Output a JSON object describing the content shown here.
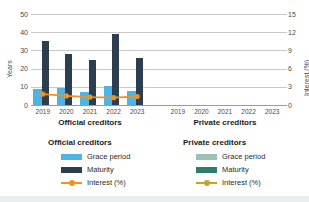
{
  "chart_data": {
    "type": "bar",
    "title": "",
    "panels": [
      {
        "name": "official",
        "title": "Official creditors",
        "categories": [
          "2019",
          "2020",
          "2021",
          "2022",
          "2023"
        ],
        "series": [
          {
            "name": "Grace period",
            "values": [
              9,
              9.5,
              7,
              10.5,
              7.5
            ],
            "color": "#4fb3e3",
            "axis": "left",
            "type": "bar"
          },
          {
            "name": "Maturity",
            "values": [
              35,
              28,
              24.5,
              39,
              26
            ],
            "color": "#2c3e50",
            "axis": "left",
            "type": "bar"
          },
          {
            "name": "Interest (%)",
            "values": [
              1.8,
              1.5,
              1.3,
              1.2,
              1.4
            ],
            "color": "#f5921e",
            "axis": "right",
            "type": "line"
          }
        ]
      },
      {
        "name": "private",
        "title": "Private creditors",
        "categories": [
          "2019",
          "2020",
          "2021",
          "2022",
          "2023"
        ],
        "series": [
          {
            "name": "Grace period",
            "values": [],
            "color": "#9dc1b4",
            "axis": "left",
            "type": "bar"
          },
          {
            "name": "Maturity",
            "values": [],
            "color": "#2e7d6e",
            "axis": "left",
            "type": "bar"
          },
          {
            "name": "Interest (%)",
            "values": [],
            "color": "#c9a227",
            "axis": "right",
            "type": "line"
          }
        ]
      }
    ],
    "ylabel": "Years",
    "ylim": [
      0,
      50
    ],
    "yticks": [
      "50",
      "40",
      "30",
      "20",
      "10",
      "0"
    ],
    "y2label": "Interest (%)",
    "y2lim": [
      0,
      15
    ],
    "y2ticks": [
      "15",
      "12",
      "9",
      "6",
      "3",
      "0"
    ],
    "xlabel": "",
    "grid": true,
    "legend_position": "bottom"
  },
  "axes": {
    "left_label": "Years",
    "right_label": "Interest (%)",
    "left_ticks": [
      "50",
      "40",
      "30",
      "20",
      "10",
      "0"
    ],
    "right_ticks": [
      "15",
      "12",
      "9",
      "6",
      "3",
      "0"
    ]
  },
  "panels": {
    "official": {
      "title": "Official creditors",
      "xticks": [
        "2019",
        "2020",
        "2021",
        "2022",
        "2023"
      ]
    },
    "private": {
      "title": "Private creditors",
      "xticks": [
        "2019",
        "2020",
        "2021",
        "2022",
        "2023"
      ]
    }
  },
  "legend": {
    "official": {
      "heading": "Official creditors",
      "items": [
        {
          "label": "Grace period",
          "color": "#4fb3e3"
        },
        {
          "label": "Maturity",
          "color": "#2c3e50"
        },
        {
          "label": "Interest (%)",
          "color": "#f5921e"
        }
      ]
    },
    "private": {
      "heading": "Private creditors",
      "items": [
        {
          "label": "Grace period",
          "color": "#9dc1b4"
        },
        {
          "label": "Maturity",
          "color": "#2e7d6e"
        },
        {
          "label": "Interest (%)",
          "color": "#c9a227"
        }
      ]
    }
  }
}
